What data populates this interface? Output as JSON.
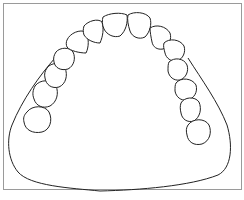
{
  "figure": {
    "frame_color": "#9a9a9a",
    "stroke_color": "#222222",
    "background": "#ffffff",
    "tooth_count": 14,
    "teeth": [
      {
        "id": "left-second-molar",
        "side": "left"
      },
      {
        "id": "left-first-molar",
        "side": "left"
      },
      {
        "id": "left-second-premolar",
        "side": "left"
      },
      {
        "id": "left-first-premolar",
        "side": "left"
      },
      {
        "id": "left-canine",
        "side": "left"
      },
      {
        "id": "left-lateral-incisor",
        "side": "left"
      },
      {
        "id": "left-central-incisor",
        "side": "left"
      },
      {
        "id": "right-central-incisor",
        "side": "right"
      },
      {
        "id": "right-lateral-incisor",
        "side": "right"
      },
      {
        "id": "right-canine",
        "side": "right"
      },
      {
        "id": "right-first-premolar",
        "side": "right"
      },
      {
        "id": "right-second-premolar",
        "side": "right"
      },
      {
        "id": "right-first-molar",
        "side": "right"
      },
      {
        "id": "right-second-molar",
        "side": "right"
      }
    ]
  },
  "caption": {
    "text": ""
  }
}
